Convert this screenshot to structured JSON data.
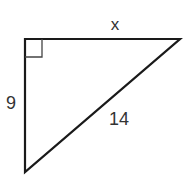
{
  "diagram": {
    "type": "right-triangle",
    "stroke_color": "#1a1a1a",
    "label_color": "#333333",
    "vertices": {
      "top_left": [
        25,
        39
      ],
      "top_right": [
        180,
        39
      ],
      "bottom": [
        25,
        172
      ]
    },
    "right_angle_at": "top_left",
    "labels": {
      "top_side": "x",
      "left_side": "9",
      "hypotenuse": "14"
    }
  }
}
